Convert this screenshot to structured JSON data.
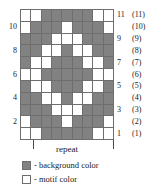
{
  "colors": {
    "background_color": "#828282",
    "motif_color": "#ffffff",
    "grid_line": "#6e6e6e",
    "text": "#1a1a1a"
  },
  "chart_data": {
    "type": "heatmap",
    "title": "",
    "xlabel": "",
    "ylabel": "",
    "columns": 9,
    "rows": 11,
    "legend": [
      {
        "swatch": "background",
        "label": "- background color"
      },
      {
        "swatch": "motif",
        "label": "- motif color"
      }
    ],
    "row_labels_left": [
      "",
      "10",
      "",
      "8",
      "",
      "6",
      "",
      "4",
      "",
      "2",
      ""
    ],
    "row_labels_right_primary": [
      "11",
      "",
      "9",
      "",
      "7",
      "",
      "5",
      "",
      "3",
      "",
      "1"
    ],
    "row_labels_right_secondary": [
      "(11)",
      "(10)",
      "(9)",
      "(8)",
      "(7)",
      "(6)",
      "(5)",
      "(4)",
      "(3)",
      "(2)",
      "(1)"
    ],
    "repeat_label": "repeat",
    "repeat_span_columns": [
      2,
      9
    ],
    "cell_codes": {
      "1": "background",
      "0": "motif"
    },
    "grid_top_to_bottom": [
      [
        0,
        0,
        1,
        1,
        1,
        1,
        1,
        0,
        0
      ],
      [
        0,
        1,
        1,
        1,
        0,
        1,
        1,
        1,
        0
      ],
      [
        1,
        1,
        1,
        0,
        0,
        0,
        1,
        1,
        1
      ],
      [
        1,
        1,
        0,
        0,
        1,
        0,
        0,
        1,
        1
      ],
      [
        1,
        0,
        0,
        1,
        1,
        1,
        0,
        0,
        1
      ],
      [
        0,
        0,
        1,
        1,
        1,
        1,
        1,
        0,
        0
      ],
      [
        1,
        0,
        0,
        1,
        1,
        1,
        0,
        0,
        1
      ],
      [
        1,
        1,
        0,
        0,
        1,
        0,
        0,
        1,
        1
      ],
      [
        1,
        1,
        1,
        0,
        0,
        0,
        1,
        1,
        1
      ],
      [
        0,
        1,
        1,
        1,
        0,
        1,
        1,
        1,
        0
      ],
      [
        0,
        0,
        1,
        1,
        1,
        1,
        1,
        0,
        0
      ]
    ]
  }
}
